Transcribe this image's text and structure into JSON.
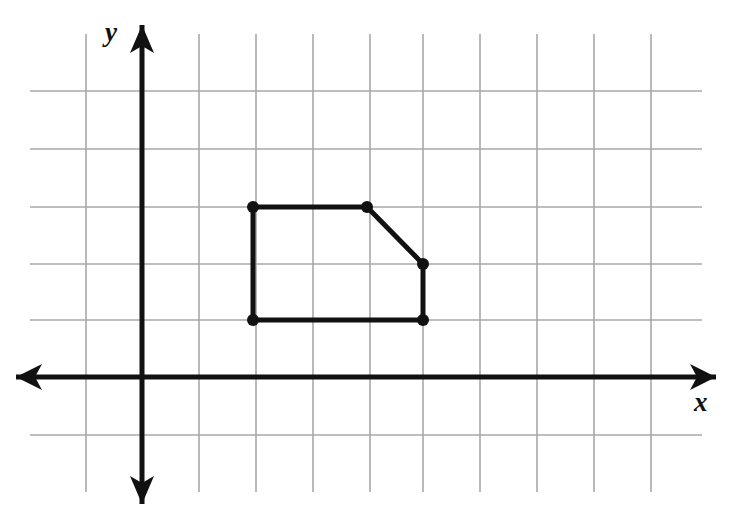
{
  "figure": {
    "kind": "coordinate-plane-polygon",
    "width": 732,
    "height": 506,
    "background_color": "#ffffff"
  },
  "axes": {
    "x_label": "x",
    "y_label": "y",
    "axis_color": "#111111",
    "axis_stroke_width": 5,
    "origin_px": {
      "x": 142,
      "y": 377
    },
    "x_axis": {
      "start_px": {
        "x": 16,
        "y": 377
      },
      "end_px": {
        "x": 716,
        "y": 377
      },
      "arrows": "both"
    },
    "y_axis": {
      "start_px": {
        "x": 142,
        "y": 25
      },
      "end_px": {
        "x": 142,
        "y": 504
      },
      "arrows": "both"
    }
  },
  "grid": {
    "color": "#a8a8a8",
    "stroke_width": 1.6,
    "spacing_px": 57,
    "x_extent_px": {
      "min": 30,
      "max": 702
    },
    "y_extent_px": {
      "min": 34,
      "max": 492
    },
    "vertical_lines_px": [
      86,
      142,
      199,
      256,
      313,
      370,
      423,
      480,
      537,
      594,
      651
    ],
    "horizontal_lines_px": [
      91,
      149,
      207,
      264,
      320,
      377,
      435
    ]
  },
  "chart_data": {
    "type": "scatter",
    "title": "",
    "xlabel": "x",
    "ylabel": "y",
    "grid": true,
    "legend": "none",
    "unit_px": 57,
    "xlim": [
      -2,
      10
    ],
    "ylim": [
      -2,
      6
    ],
    "shape": {
      "name": "pentagon",
      "closed": true,
      "stroke_color": "#111111",
      "stroke_width": 5,
      "vertex_marker": "filled-circle",
      "vertex_radius_px": 6,
      "vertices_grid": [
        {
          "x": 2,
          "y": 3
        },
        {
          "x": 4,
          "y": 3
        },
        {
          "x": 5,
          "y": 2
        },
        {
          "x": 5,
          "y": 1
        },
        {
          "x": 2,
          "y": 1
        }
      ],
      "vertices_px": [
        {
          "x": 253,
          "y": 207
        },
        {
          "x": 367,
          "y": 207
        },
        {
          "x": 423,
          "y": 264
        },
        {
          "x": 423,
          "y": 320
        },
        {
          "x": 253,
          "y": 320
        }
      ],
      "edges": [
        {
          "from": 0,
          "to": 1,
          "orientation": "horizontal"
        },
        {
          "from": 1,
          "to": 2,
          "orientation": "diagonal"
        },
        {
          "from": 2,
          "to": 3,
          "orientation": "vertical"
        },
        {
          "from": 3,
          "to": 4,
          "orientation": "horizontal"
        },
        {
          "from": 4,
          "to": 0,
          "orientation": "vertical"
        }
      ]
    }
  }
}
